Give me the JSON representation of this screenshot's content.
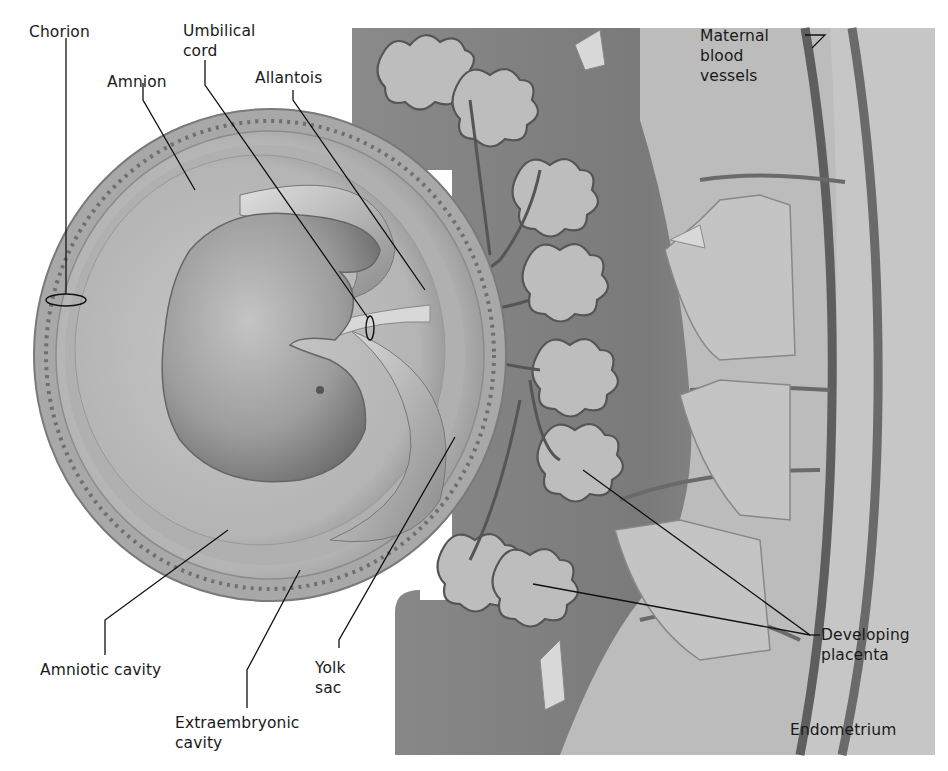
{
  "figure": {
    "colors": {
      "background": "#ffffff",
      "uterine_tissue": "#b8b8b8",
      "uterine_dark": "#6e6e6e",
      "endometrium": "#c9c9c9",
      "membrane_outer": "#a6a6a6",
      "amniotic_fluid": "#bdbdbd",
      "embryo": "#9a9a9a",
      "vessel": "#5a5a5a",
      "label_text": "#1a1a1a"
    },
    "labels": [
      {
        "id": "chorion",
        "text": "Chorion"
      },
      {
        "id": "umbilical-cord",
        "text": "Umbilical\ncord"
      },
      {
        "id": "amnion",
        "text": "Amnion"
      },
      {
        "id": "allantois",
        "text": "Allantois"
      },
      {
        "id": "maternal-blood-vessels",
        "text": "Maternal\nblood\nvessels"
      },
      {
        "id": "amniotic-cavity",
        "text": "Amniotic cavity"
      },
      {
        "id": "yolk-sac",
        "text": "Yolk\nsac"
      },
      {
        "id": "extraembryonic-cavity",
        "text": "Extraembryonic\ncavity"
      },
      {
        "id": "developing-placenta",
        "text": "Developing\nplacenta"
      },
      {
        "id": "endometrium",
        "text": "Endometrium"
      }
    ]
  }
}
